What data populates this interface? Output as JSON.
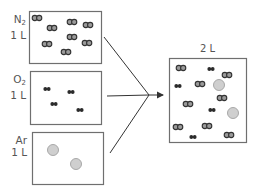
{
  "diagram": {
    "colors": {
      "box_border": "#6f6f6f",
      "n2_fill": "#9a9a9a",
      "n2_stroke": "#333333",
      "o2_fill": "#2b2b2b",
      "ar_fill": "#cfcfcf",
      "ar_stroke": "#a8a8a8",
      "arrow": "#333333",
      "text": "#555555"
    },
    "containers": [
      {
        "id": "n2",
        "gas_symbol": "N",
        "gas_subscript": "2",
        "volume": "1 L",
        "box": {
          "x": 29,
          "y": 11,
          "w": 72,
          "h": 52
        },
        "molecules": [
          {
            "type": "N2",
            "x": 37,
            "y": 18
          },
          {
            "type": "N2",
            "x": 52,
            "y": 28
          },
          {
            "type": "N2",
            "x": 72,
            "y": 22
          },
          {
            "type": "N2",
            "x": 88,
            "y": 25
          },
          {
            "type": "N2",
            "x": 72,
            "y": 37
          },
          {
            "type": "N2",
            "x": 87,
            "y": 43
          },
          {
            "type": "N2",
            "x": 47,
            "y": 44
          },
          {
            "type": "N2",
            "x": 66,
            "y": 52
          }
        ]
      },
      {
        "id": "o2",
        "gas_symbol": "O",
        "gas_subscript": "2",
        "volume": "1 L",
        "box": {
          "x": 30,
          "y": 71,
          "w": 71,
          "h": 53
        },
        "molecules": [
          {
            "type": "O2",
            "x": 47,
            "y": 89
          },
          {
            "type": "O2",
            "x": 71,
            "y": 92
          },
          {
            "type": "O2",
            "x": 54,
            "y": 104
          },
          {
            "type": "O2",
            "x": 80,
            "y": 110
          }
        ]
      },
      {
        "id": "ar",
        "gas_symbol": "Ar",
        "gas_subscript": "",
        "volume": "1 L",
        "box": {
          "x": 32,
          "y": 132,
          "w": 71,
          "h": 52
        },
        "molecules": [
          {
            "type": "Ar",
            "x": 53,
            "y": 150
          },
          {
            "type": "Ar",
            "x": 76,
            "y": 164
          }
        ]
      }
    ],
    "mixture": {
      "volume": "2 L",
      "box": {
        "x": 169,
        "y": 58,
        "w": 77,
        "h": 84
      },
      "molecules": [
        {
          "type": "N2",
          "x": 181,
          "y": 68
        },
        {
          "type": "O2",
          "x": 211,
          "y": 69
        },
        {
          "type": "N2",
          "x": 227,
          "y": 75
        },
        {
          "type": "O2",
          "x": 178,
          "y": 86
        },
        {
          "type": "N2",
          "x": 200,
          "y": 84
        },
        {
          "type": "Ar",
          "x": 219,
          "y": 85
        },
        {
          "type": "N2",
          "x": 222,
          "y": 98
        },
        {
          "type": "N2",
          "x": 188,
          "y": 104
        },
        {
          "type": "O2",
          "x": 212,
          "y": 110
        },
        {
          "type": "Ar",
          "x": 233,
          "y": 113
        },
        {
          "type": "N2",
          "x": 178,
          "y": 127
        },
        {
          "type": "N2",
          "x": 207,
          "y": 126
        },
        {
          "type": "O2",
          "x": 193,
          "y": 137
        },
        {
          "type": "N2",
          "x": 229,
          "y": 135
        }
      ]
    },
    "arrows": {
      "converge_point": {
        "x": 149,
        "y": 95
      },
      "sources": [
        {
          "x": 104,
          "y": 37
        },
        {
          "x": 107,
          "y": 96
        },
        {
          "x": 110,
          "y": 153
        }
      ],
      "head_to": {
        "x": 163,
        "y": 95
      }
    }
  }
}
